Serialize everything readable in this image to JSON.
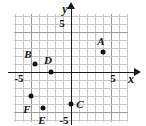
{
  "figure": {
    "type": "coordinate-plane",
    "axes": {
      "x_label": "x",
      "y_label": "y",
      "x_tick_negative": "-5",
      "x_tick_positive": "5",
      "y_tick_positive": "5",
      "y_tick_negative": "-5",
      "x_range": [
        -7,
        7
      ],
      "y_range": [
        -6.5,
        7
      ],
      "grid": true,
      "origin_px": [
        71,
        72
      ],
      "units_per_px": 8
    },
    "colors": {
      "axis": "#1a1a1a",
      "grid_major": "#9a9a9a",
      "grid_minor": "#c9c9c9",
      "point": "#111111",
      "background": "#ffffff"
    },
    "points": [
      {
        "name": "A",
        "label": "A",
        "x": 4,
        "y": 2.5,
        "label_dx": -2,
        "label_dy": -11
      },
      {
        "name": "B",
        "label": "B",
        "x": -4.5,
        "y": 1,
        "label_dx": -7,
        "label_dy": -10
      },
      {
        "name": "C",
        "label": "C",
        "x": 0,
        "y": -4,
        "label_dx": 9,
        "label_dy": 0
      },
      {
        "name": "D",
        "label": "D",
        "x": -2.5,
        "y": 0,
        "label_dx": -3,
        "label_dy": -12
      },
      {
        "name": "E",
        "label": "E",
        "x": -3.5,
        "y": -4.5,
        "label_dx": -1,
        "label_dy": 12
      },
      {
        "name": "F",
        "label": "F",
        "x": -5,
        "y": -3,
        "label_dx": -4,
        "label_dy": 13
      }
    ]
  }
}
